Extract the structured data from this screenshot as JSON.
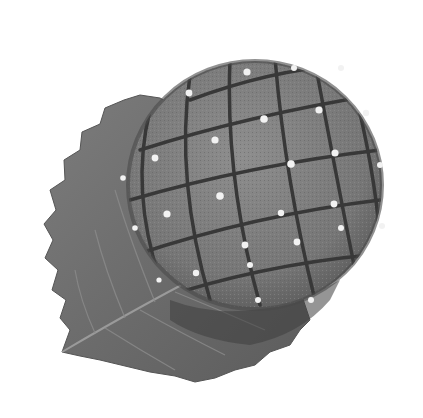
{
  "image": {
    "description": "Grayscale photo of a round wagashi-style sweet with a crosshatched grid surface and small white dots, resting on a serrated leaf",
    "background": "#ffffff",
    "subject": {
      "name": "sweet-ball",
      "fill": "#7a7a7a",
      "shadow": "#4a4a4a",
      "highlight": "#8c8c8c",
      "groove_color": "#3a3a3a",
      "dot_color": "#f2f2f2",
      "center": [
        255,
        185
      ],
      "radius": [
        125,
        122
      ]
    },
    "leaf": {
      "name": "serrated-leaf",
      "fill": "#6e6e6e",
      "vein_color": "#8a8a8a",
      "edge_color": "#5a5a5a"
    },
    "dots": [
      [
        247,
        72
      ],
      [
        294,
        68
      ],
      [
        341,
        68
      ],
      [
        189,
        93
      ],
      [
        264,
        119
      ],
      [
        319,
        110
      ],
      [
        366,
        113
      ],
      [
        215,
        140
      ],
      [
        291,
        164
      ],
      [
        335,
        153
      ],
      [
        380,
        165
      ],
      [
        155,
        158
      ],
      [
        123,
        178
      ],
      [
        220,
        196
      ],
      [
        281,
        213
      ],
      [
        334,
        204
      ],
      [
        382,
        226
      ],
      [
        167,
        214
      ],
      [
        135,
        228
      ],
      [
        245,
        245
      ],
      [
        297,
        242
      ],
      [
        341,
        228
      ],
      [
        196,
        273
      ],
      [
        250,
        265
      ],
      [
        311,
        300
      ],
      [
        258,
        300
      ],
      [
        159,
        280
      ]
    ]
  }
}
